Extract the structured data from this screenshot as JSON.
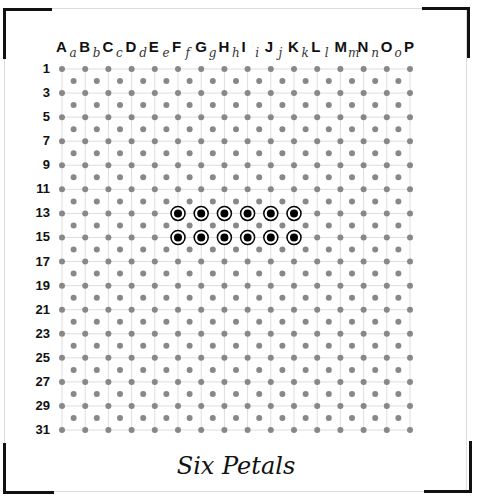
{
  "title": "Six Petals",
  "grid": {
    "columns": [
      "A",
      "B",
      "C",
      "D",
      "E",
      "F",
      "G",
      "H",
      "I",
      "J",
      "K",
      "L",
      "M",
      "N",
      "O",
      "P"
    ],
    "sub_columns": [
      "a",
      "b",
      "c",
      "d",
      "e",
      "f",
      "g",
      "h",
      "i",
      "j",
      "k",
      "l",
      "m",
      "n",
      "o"
    ],
    "row_labels": [
      "1",
      "3",
      "5",
      "7",
      "9",
      "11",
      "13",
      "15",
      "17",
      "19",
      "21",
      "23",
      "25",
      "27",
      "29",
      "31"
    ],
    "dot_color": "#888888",
    "line_color": "#dddddd"
  },
  "marked_pins": [
    {
      "col": "F",
      "row": "13"
    },
    {
      "col": "G",
      "row": "13"
    },
    {
      "col": "H",
      "row": "13"
    },
    {
      "col": "I",
      "row": "13"
    },
    {
      "col": "J",
      "row": "13"
    },
    {
      "col": "K",
      "row": "13"
    },
    {
      "col": "F",
      "row": "15"
    },
    {
      "col": "G",
      "row": "15"
    },
    {
      "col": "H",
      "row": "15"
    },
    {
      "col": "I",
      "row": "15"
    },
    {
      "col": "J",
      "row": "15"
    },
    {
      "col": "K",
      "row": "15"
    }
  ],
  "marked_pin_color": "#000000"
}
